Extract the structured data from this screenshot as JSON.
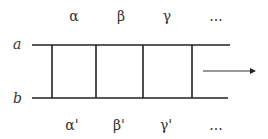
{
  "diagram": {
    "rails": {
      "top": {
        "label": "a",
        "y": 45,
        "x1": 32,
        "x2": 230
      },
      "bottom": {
        "label": "b",
        "y": 98,
        "x1": 32,
        "x2": 228
      }
    },
    "rungs_x": [
      52,
      96,
      143,
      192
    ],
    "top_labels": [
      {
        "text": "α",
        "x": 74
      },
      {
        "text": "β",
        "x": 121
      },
      {
        "text": "γ",
        "x": 167
      },
      {
        "text": "...",
        "x": 216
      }
    ],
    "bottom_labels": [
      {
        "text": "α'",
        "x": 72
      },
      {
        "text": "β'",
        "x": 119
      },
      {
        "text": "γ'",
        "x": 166
      },
      {
        "text": "...",
        "x": 216
      }
    ],
    "arrow": {
      "x1": 203,
      "x2": 254,
      "y": 71,
      "direction": "right"
    },
    "colors": {
      "line": "#222222",
      "text": "#333333"
    }
  }
}
